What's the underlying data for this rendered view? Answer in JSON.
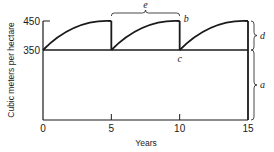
{
  "chart_data": {
    "type": "line",
    "title": "",
    "xlabel": "Years",
    "ylabel": "Cubic meters per hectare",
    "xlim": [
      0,
      15
    ],
    "ylim": [
      0,
      450
    ],
    "x_ticks": [
      0,
      5,
      10,
      15
    ],
    "x_tick_labels": [
      "0",
      "5",
      "10",
      "15"
    ],
    "y_ticks": [
      350,
      450
    ],
    "y_tick_labels": [
      "350",
      "450"
    ],
    "grid": false,
    "legend": "none",
    "series": [
      {
        "name": "Growing stock (sawtooth harvest cycle)",
        "cycles": [
          {
            "start_year": 0,
            "end_year": 5,
            "start_value": 350,
            "end_value": 450
          },
          {
            "start_year": 5,
            "end_year": 10,
            "start_value": 350,
            "end_value": 450
          },
          {
            "start_year": 10,
            "end_year": 15,
            "start_value": 350,
            "end_value": 450
          }
        ]
      },
      {
        "name": "Base stock",
        "x": [
          0,
          15
        ],
        "y": [
          350,
          350
        ]
      }
    ],
    "annotations": [
      {
        "label": "e",
        "kind": "brace-top",
        "x_from": 5,
        "x_to": 10,
        "meaning": "cutting cycle"
      },
      {
        "label": "b",
        "kind": "point",
        "x": 10,
        "y": 450
      },
      {
        "label": "c",
        "kind": "point",
        "x": 10,
        "y": 350
      },
      {
        "label": "d",
        "kind": "brace-right",
        "y_from": 350,
        "y_to": 450
      },
      {
        "label": "a",
        "kind": "brace-right",
        "y_from": 0,
        "y_to": 350
      }
    ],
    "colors": {
      "ink": "#1a1a1a",
      "background": "#ffffff"
    }
  }
}
